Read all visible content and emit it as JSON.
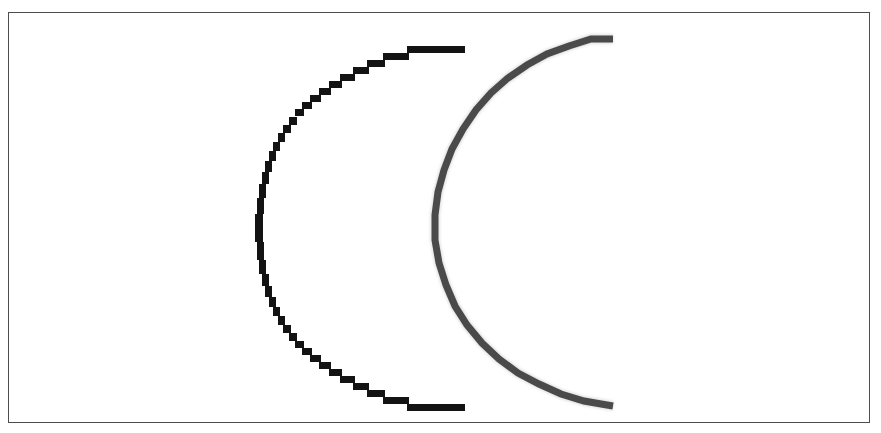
{
  "figure": {
    "title": "",
    "background_color": "#ffffff",
    "frame": {
      "name": "figure-border",
      "color": "#4d4d4d",
      "x": 8,
      "y": 12,
      "width": 862,
      "height": 411,
      "stroke_width": 1
    }
  },
  "chart_data": {
    "type": "line",
    "title": "",
    "subtitle": "",
    "xlabel": "",
    "ylabel": "",
    "xlim": [
      0,
      862
    ],
    "ylim": [
      0,
      411
    ],
    "grid": false,
    "legend": "none",
    "axes_visible": false,
    "tick_labels_x": [],
    "tick_labels_y": [],
    "annotations": [],
    "description": "Two nested open C-shaped arcs (crescent outlines) opening to the right, rendered pixelated at low resolution on a white background inside a thin rectangular border.",
    "series": [
      {
        "name": "black-arc",
        "label": "",
        "color": "#131313",
        "style": "solid",
        "stroke_width": 7,
        "shape": "arc",
        "center_x": 454,
        "center_y": 227,
        "radius": 192,
        "start_angle_deg": -172,
        "end_angle_deg": 172,
        "open_side": "right",
        "rendering": "aliased-stairstep",
        "endpoint_top": [
          463,
          48
        ],
        "endpoint_bottom": [
          460,
          406
        ],
        "leftmost": [
          273,
          228
        ],
        "values": []
      },
      {
        "name": "gray-arc",
        "label": "",
        "color": "#4a4a4a",
        "halo_color": "#a8a8a8",
        "style": "solid",
        "stroke_width": 7,
        "shape": "arc",
        "center_x": 608,
        "center_y": 221,
        "radius": 182,
        "start_angle_deg": -172,
        "end_angle_deg": 172,
        "open_side": "right",
        "rendering": "blurred-antialiased",
        "endpoint_top": [
          612,
          38
        ],
        "endpoint_bottom": [
          610,
          406
        ],
        "leftmost": [
          434,
          222
        ],
        "values": []
      }
    ]
  }
}
